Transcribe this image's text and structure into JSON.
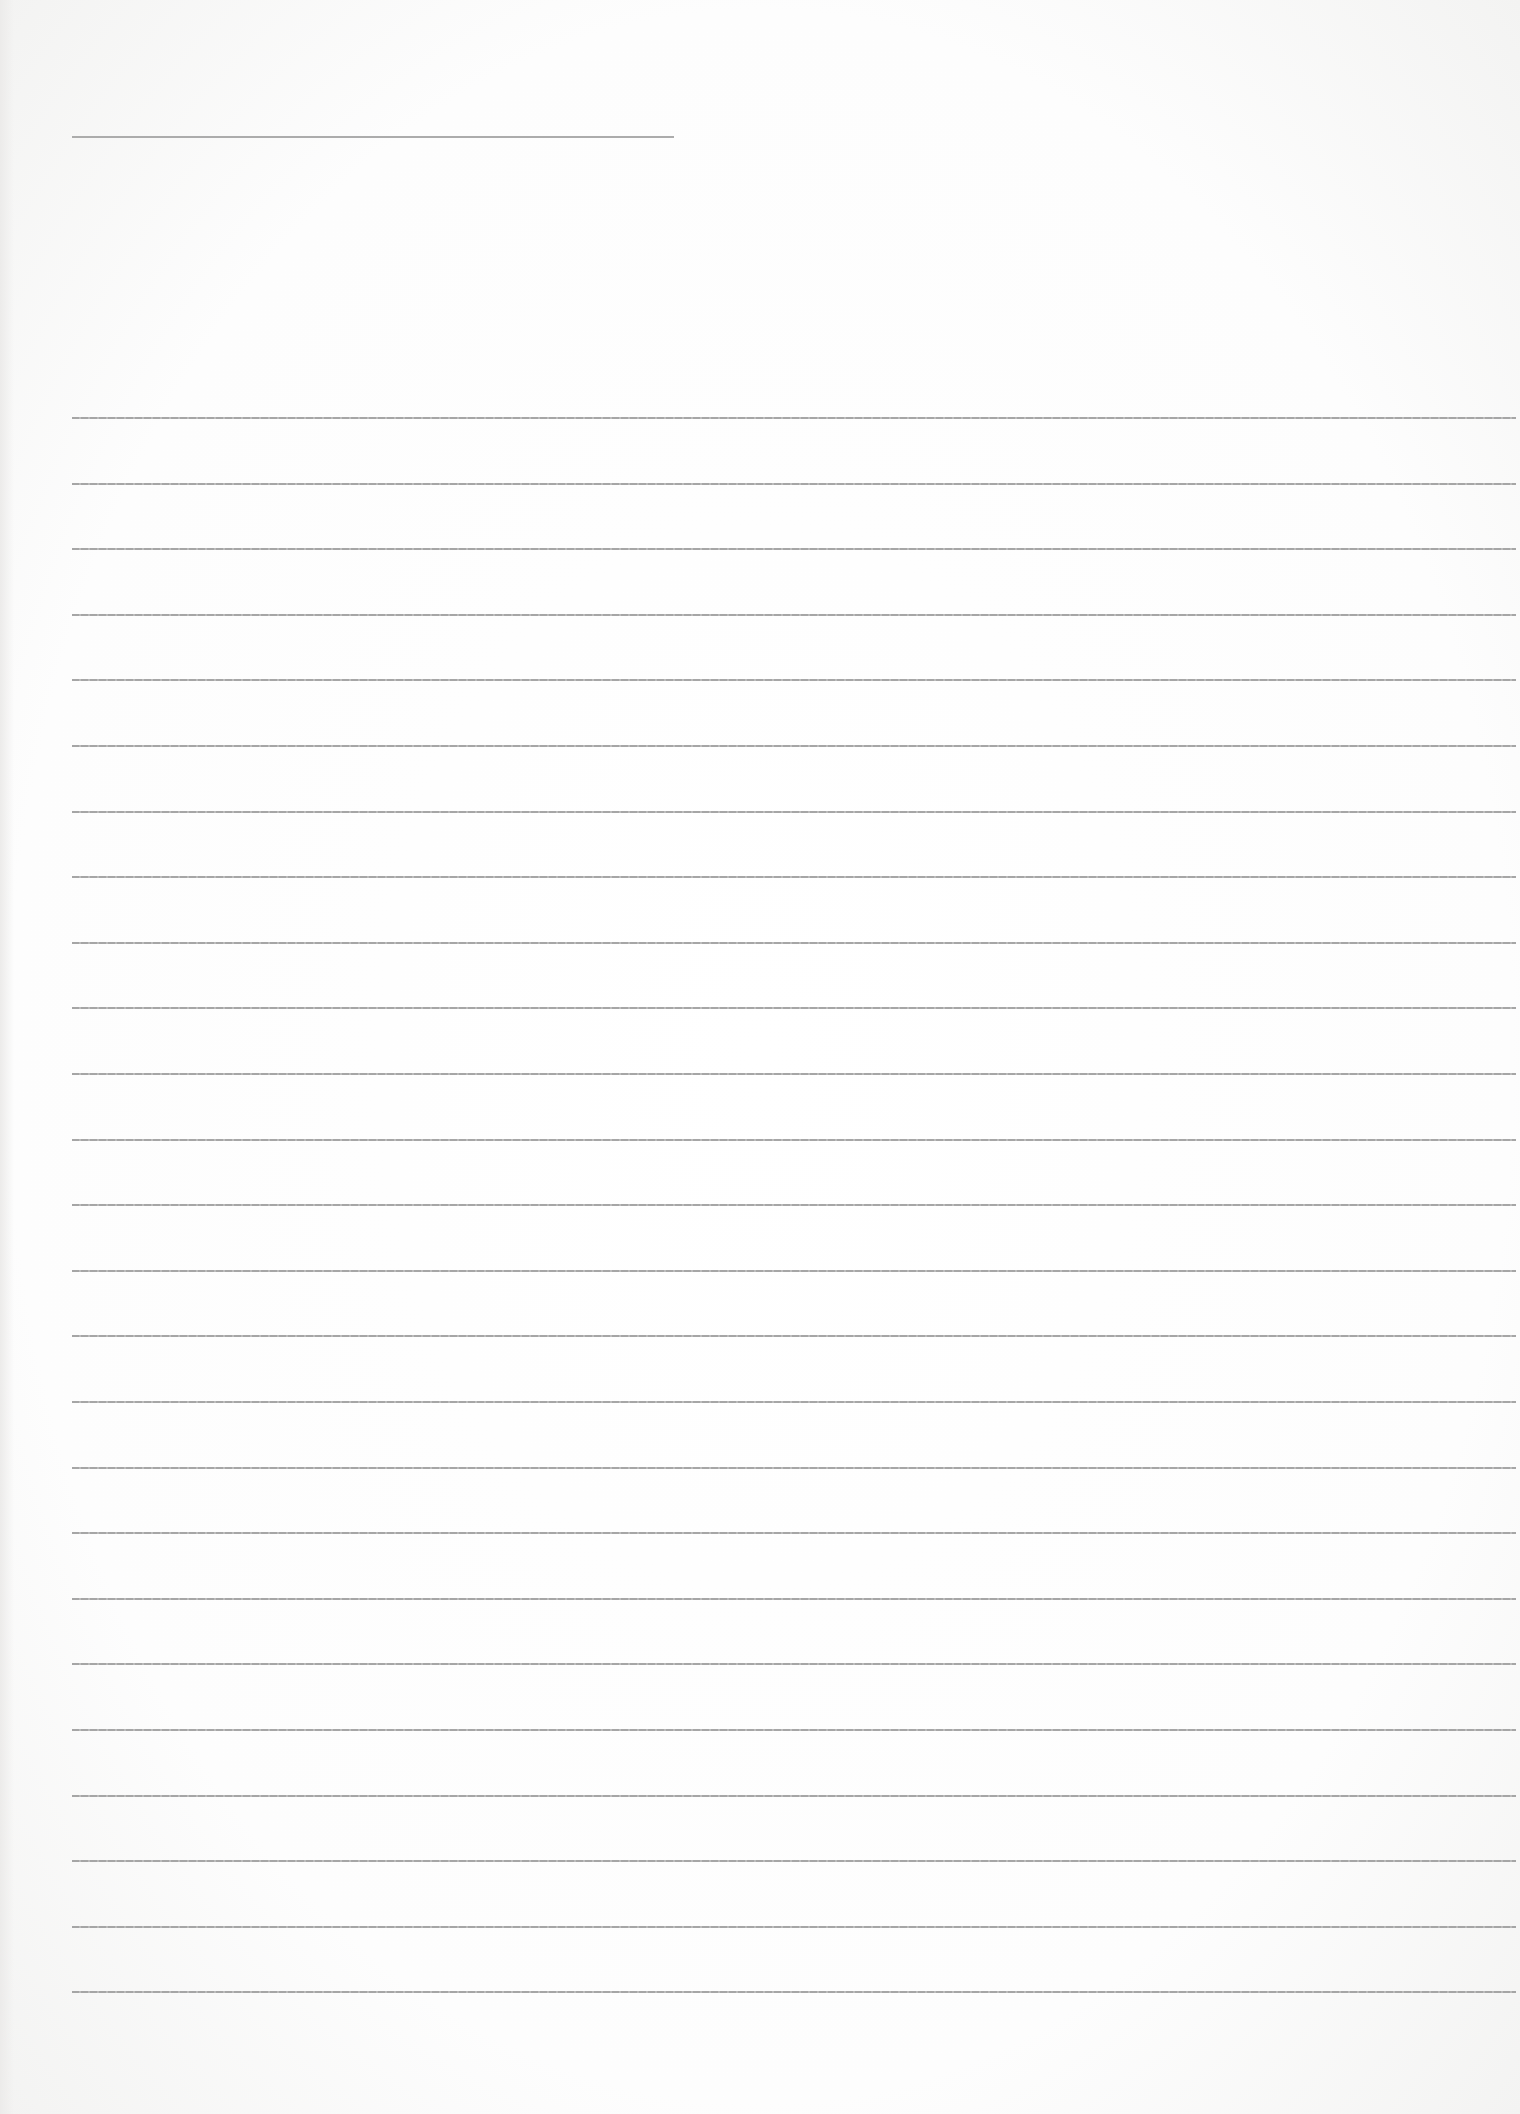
{
  "document": {
    "type": "lined paper",
    "header_line": {
      "x": 72,
      "y": 136,
      "width": 602
    },
    "ruled_lines": {
      "count": 25,
      "x": 72,
      "first_y": 417,
      "spacing": 65.6,
      "width": 1444
    },
    "line_color": "#9c9c9c",
    "background_color": "#fdfdfd",
    "text_content": []
  }
}
